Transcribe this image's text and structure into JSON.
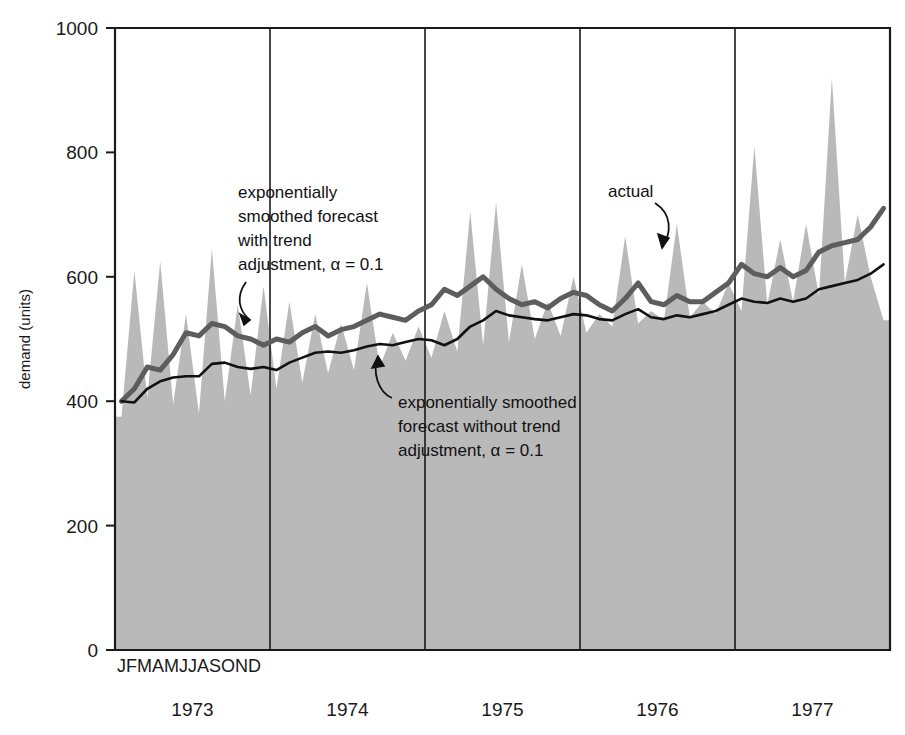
{
  "chart_data": {
    "type": "area",
    "title": "",
    "xlabel": "",
    "ylabel": "demand (units)",
    "ylim": [
      0,
      1000
    ],
    "yticks": [
      0,
      200,
      400,
      600,
      800,
      1000
    ],
    "ytick_labels": [
      "0",
      "200",
      "400",
      "600",
      "800",
      "1000"
    ],
    "grid": false,
    "legend_position": "inline-annotations",
    "month_initials": "JFMAMJJASOND",
    "months": [
      "J",
      "F",
      "M",
      "A",
      "M",
      "J",
      "J",
      "A",
      "S",
      "O",
      "N",
      "D"
    ],
    "year_labels": [
      "1973",
      "1974",
      "1975",
      "1976",
      "1977"
    ],
    "x_range_years": [
      1973,
      1978
    ],
    "fill_color": "#b9b9b9",
    "series": [
      {
        "name": "actual",
        "style": "filled-area",
        "color": "#b9b9b9",
        "values": [
          375,
          610,
          405,
          625,
          395,
          540,
          380,
          645,
          400,
          555,
          410,
          585,
          420,
          560,
          430,
          540,
          445,
          525,
          450,
          590,
          455,
          510,
          465,
          520,
          470,
          545,
          480,
          705,
          490,
          720,
          495,
          620,
          500,
          560,
          505,
          600,
          510,
          540,
          520,
          665,
          525,
          545,
          530,
          685,
          535,
          560,
          540,
          590,
          545,
          810,
          555,
          660,
          560,
          685,
          570,
          920,
          590,
          700,
          600,
          530
        ]
      },
      {
        "name": "exponentially smoothed forecast with trend adjustment, alpha = 0.1",
        "style": "line-thick-gray",
        "color": "#5d5d5d",
        "alpha": 0.1,
        "values": [
          400,
          420,
          455,
          450,
          475,
          510,
          505,
          525,
          520,
          505,
          500,
          490,
          500,
          495,
          510,
          520,
          505,
          515,
          520,
          530,
          540,
          535,
          530,
          545,
          555,
          580,
          570,
          585,
          600,
          580,
          565,
          555,
          560,
          550,
          565,
          575,
          570,
          555,
          545,
          565,
          590,
          560,
          555,
          570,
          560,
          560,
          575,
          590,
          620,
          605,
          600,
          615,
          600,
          610,
          640,
          650,
          655,
          660,
          680,
          710
        ]
      },
      {
        "name": "exponentially smoothed forecast without trend adjustment, alpha = 0.1",
        "style": "line-thin-black",
        "color": "#111111",
        "alpha": 0.1,
        "values": [
          400,
          398,
          420,
          432,
          438,
          440,
          440,
          460,
          462,
          455,
          452,
          455,
          450,
          462,
          470,
          478,
          480,
          478,
          482,
          488,
          492,
          490,
          495,
          500,
          498,
          490,
          500,
          520,
          530,
          545,
          538,
          535,
          532,
          530,
          535,
          540,
          538,
          532,
          530,
          540,
          548,
          535,
          532,
          538,
          535,
          540,
          545,
          555,
          565,
          560,
          558,
          565,
          560,
          565,
          580,
          585,
          590,
          595,
          605,
          620
        ]
      }
    ],
    "annotations": [
      {
        "id": "annot-trend",
        "lines": [
          "exponentially",
          "smoothed forecast",
          "with trend",
          "adjustment, α = 0.1"
        ],
        "target": "exponentially smoothed forecast with trend adjustment"
      },
      {
        "id": "annot-no-trend",
        "lines": [
          "exponentially smoothed",
          "forecast without trend",
          "adjustment, α = 0.1"
        ],
        "target": "exponentially smoothed forecast without trend adjustment"
      },
      {
        "id": "annot-actual",
        "lines": [
          "actual"
        ],
        "target": "actual demand series"
      }
    ]
  },
  "axes": {
    "y_label": "demand (units)",
    "y_ticks": [
      "1000",
      "800",
      "600",
      "400",
      "200",
      "0"
    ],
    "x_month_row": "JFMAMJJASOND",
    "x_years": [
      "1973",
      "1974",
      "1975",
      "1976",
      "1977"
    ]
  },
  "annotations": {
    "trend": {
      "line1": "exponentially",
      "line2": "smoothed forecast",
      "line3": "with trend",
      "line4": "adjustment, α = 0.1"
    },
    "no_trend": {
      "line1": "exponentially smoothed",
      "line2": "forecast without trend",
      "line3": "adjustment, α = 0.1"
    },
    "actual": {
      "label": "actual"
    }
  },
  "colors": {
    "area_fill": "#b9b9b9",
    "trend_line": "#5d5d5d",
    "plain_line": "#111111",
    "frame": "#1a1a1a"
  }
}
